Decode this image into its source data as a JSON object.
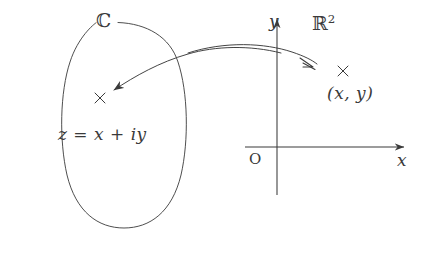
{
  "figure": {
    "background_color": "#ffffff",
    "stroke_color": "#3a3a3a",
    "width": 432,
    "height": 272
  },
  "complex_region": {
    "set_label": "ℂ",
    "point_marker": "×",
    "point_expression": "z = x + iy",
    "shape": "ellipse"
  },
  "real_region": {
    "set_label": "ℝ",
    "set_label_exponent": "2",
    "point_marker": "×",
    "point_coordinates": "(x,  y)",
    "origin_label": "O",
    "x_axis_label": "x",
    "y_axis_label": "y"
  },
  "mapping_arrow": {
    "description": "bidirectional curved arrow between C and R^2",
    "left_arrowhead": "←",
    "right_arrowhead": "⇢"
  }
}
